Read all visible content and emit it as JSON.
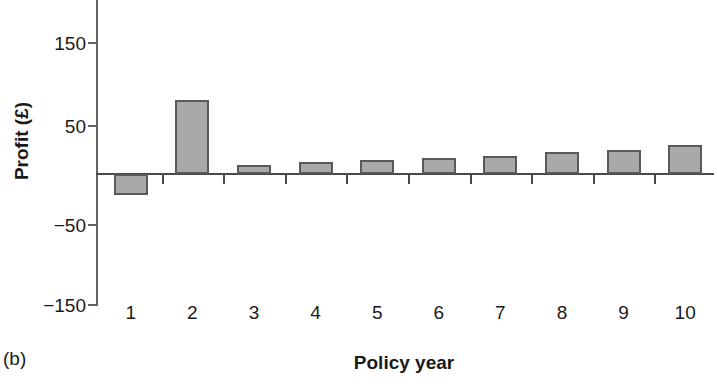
{
  "chart_data": {
    "type": "bar",
    "title": "",
    "panel_label": "(b)",
    "xlabel": "Policy year",
    "ylabel": "Profit (£)",
    "categories": [
      "1",
      "2",
      "3",
      "4",
      "5",
      "6",
      "7",
      "8",
      "9",
      "10"
    ],
    "values": [
      -24,
      85,
      10,
      14,
      16,
      18,
      21,
      25,
      28,
      33
    ],
    "ylim": [
      -150,
      190
    ],
    "yticks": [
      150,
      50,
      -50,
      -150
    ],
    "ytick_labels": [
      "150",
      "50",
      "−50",
      "−150"
    ],
    "grid": false,
    "legend": null,
    "bar_fill_color": "#a9a9a9",
    "bar_edge_color": "#595959",
    "axis_color": "#4a4a4a",
    "background_color": "#ffffff"
  }
}
